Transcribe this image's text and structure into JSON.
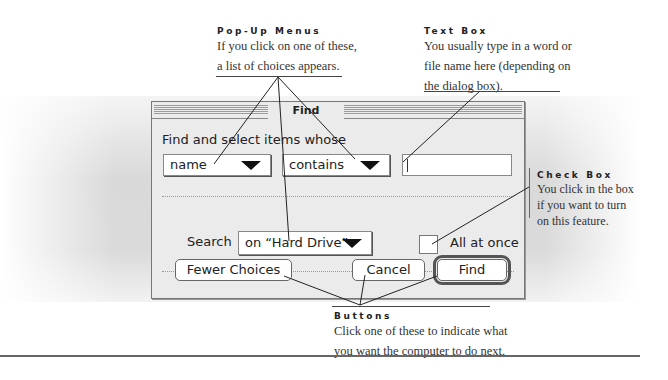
{
  "dialog": {
    "title": "Find",
    "prompt": "Find and select items whose",
    "popup_field": "name",
    "popup_operator": "contains",
    "text_value": "",
    "search_label": "Search",
    "popup_location": "on “Hard Drive”",
    "checkbox_label": "All at once",
    "checkbox_checked": false,
    "buttons": {
      "fewer": "Fewer Choices",
      "cancel": "Cancel",
      "find": "Find"
    }
  },
  "callouts": {
    "popup_menus": {
      "heading": "Pop-Up Menus",
      "line1": "If you click on one of these,",
      "line2": "a list of choices appears."
    },
    "text_box": {
      "heading": "Text Box",
      "line1": "You usually type in a word or",
      "line2": "file name here (depending on",
      "line3": "the dialog box)."
    },
    "check_box": {
      "heading": "Check Box",
      "line1": "You click in the box",
      "line2": "if you want to turn",
      "line3": "on this feature."
    },
    "buttons": {
      "heading": "Buttons",
      "line1": "Click one of these to indicate what",
      "line2": "you want the computer to do next."
    }
  }
}
